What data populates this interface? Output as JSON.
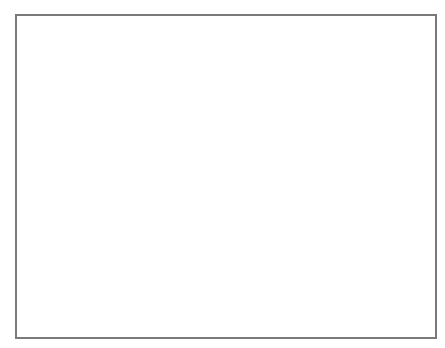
{
  "chart_data": {
    "type": "scatter",
    "title": "",
    "xlabel": "",
    "ylabel": "",
    "axes_visible": false,
    "grid": false,
    "legend": null,
    "frame": {
      "x": 15,
      "y": 14,
      "width": 420,
      "height": 323,
      "border_color": "#7a7a7a"
    },
    "marker_color": "#111111",
    "clusters": [
      {
        "id": 1,
        "marker": "diamond",
        "cx": 276,
        "cy": 40,
        "sx": 10,
        "sy": 3.2,
        "rot": 0,
        "n": 70,
        "size": 2.6,
        "extra_stars": []
      },
      {
        "id": 2,
        "marker": "star",
        "cx": 132,
        "cy": 128,
        "sx": 11,
        "sy": 7,
        "rot": -35,
        "n": 70,
        "size": 2.4,
        "extra_stars": [
          [
            156,
            125,
            5.5
          ],
          [
            146,
            147,
            4.5
          ],
          [
            163,
            157,
            4.5
          ]
        ]
      },
      {
        "id": 3,
        "marker": "triangle",
        "cx": 233,
        "cy": 131,
        "sx": 19,
        "sy": 4,
        "rot": -25,
        "n": 80,
        "size": 2.2,
        "extra_stars": []
      },
      {
        "id": 4,
        "marker": "dot",
        "cx": 393,
        "cy": 170,
        "sx": 11,
        "sy": 5,
        "rot": -5,
        "n": 85,
        "size": 1.1,
        "extra_stars": []
      },
      {
        "id": 5,
        "marker": "triangle",
        "cx": 57,
        "cy": 198,
        "sx": 10,
        "sy": 6,
        "rot": 10,
        "n": 80,
        "size": 2.3,
        "extra_stars": []
      },
      {
        "id": 6,
        "marker": "cross",
        "cx": 177,
        "cy": 208,
        "sx": 8,
        "sy": 6.5,
        "rot": 0,
        "n": 70,
        "size": 1.8,
        "extra_stars": []
      },
      {
        "id": 7,
        "marker": "square",
        "cx": 285,
        "cy": 194,
        "sx": 8,
        "sy": 9,
        "rot": 0,
        "n": 85,
        "size": 2.5,
        "extra_stars": [
          [
            268,
            182,
            4.5
          ]
        ]
      },
      {
        "id": 8,
        "marker": "circle",
        "cx": 130,
        "cy": 283,
        "sx": 8,
        "sy": 8.5,
        "rot": -20,
        "n": 90,
        "size": 2.3,
        "extra_stars": []
      },
      {
        "id": 9,
        "marker": "circle",
        "cx": 217,
        "cy": 300,
        "sx": 9,
        "sy": 8,
        "rot": 15,
        "n": 85,
        "size": 2.3,
        "extra_stars": [
          [
            195,
            295,
            4.5
          ]
        ]
      },
      {
        "id": 10,
        "marker": "star",
        "cx": 355,
        "cy": 270,
        "sx": 12,
        "sy": 7,
        "rot": -50,
        "n": 80,
        "size": 2.6,
        "extra_stars": [
          [
            352,
            258,
            4.5
          ],
          [
            335,
            289,
            5
          ]
        ]
      }
    ]
  }
}
